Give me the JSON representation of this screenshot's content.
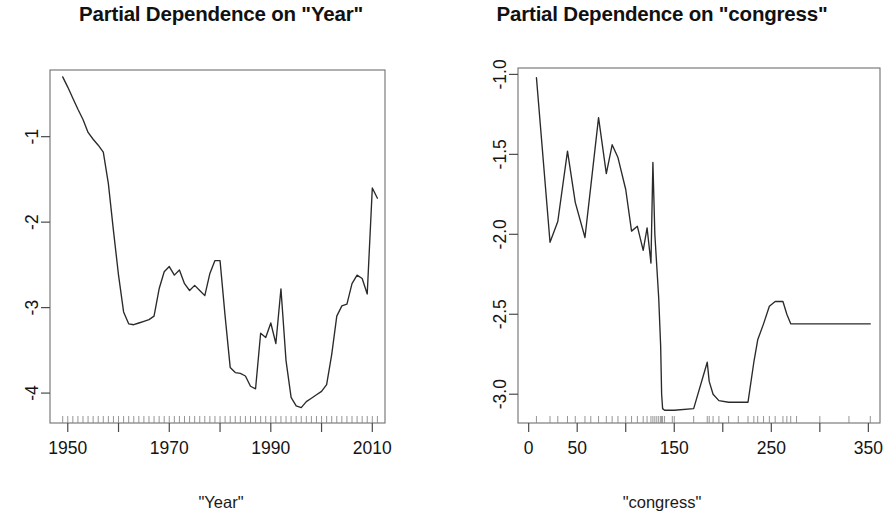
{
  "page": {
    "background": "#ffffff",
    "line_color": "#2a2a2a",
    "frame_color": "#6f6f6f",
    "width": 883,
    "height": 526
  },
  "panels": [
    {
      "id": "year",
      "title": "Partial Dependence on \"Year\"",
      "xlabel": "\"Year\""
    },
    {
      "id": "congress",
      "title": "Partial Dependence on \"congress\"",
      "xlabel": "\"congress\""
    }
  ],
  "chart_data": [
    {
      "type": "line",
      "title": "Partial Dependence on \"Year\"",
      "xlabel": "\"Year\"",
      "ylabel": "",
      "grid": false,
      "legend": null,
      "xlim": [
        1946.5,
        2012.5
      ],
      "ylim": [
        -4.35,
        -0.22
      ],
      "xticks": [
        1950,
        1960,
        1970,
        1980,
        1990,
        2000,
        2010
      ],
      "xtick_labels": [
        "1950",
        "",
        "1970",
        "",
        "1990",
        "",
        "2010"
      ],
      "yticks": [
        -1,
        -2,
        -3,
        -4
      ],
      "ytick_labels": [
        "-1",
        "-2",
        "-3",
        "-4"
      ],
      "x": [
        1949,
        1950,
        1951,
        1952,
        1953,
        1954,
        1955,
        1956,
        1957,
        1958,
        1959,
        1960,
        1961,
        1962,
        1963,
        1964,
        1965,
        1966,
        1967,
        1968,
        1969,
        1970,
        1971,
        1972,
        1973,
        1974,
        1975,
        1976,
        1977,
        1978,
        1979,
        1980,
        1981,
        1982,
        1983,
        1984,
        1985,
        1986,
        1987,
        1988,
        1989,
        1990,
        1991,
        1992,
        1993,
        1994,
        1995,
        1996,
        1997,
        1998,
        1999,
        2000,
        2001,
        2002,
        2003,
        2004,
        2005,
        2006,
        2007,
        2008,
        2009,
        2010,
        2011
      ],
      "y": [
        -0.3,
        -0.42,
        -0.55,
        -0.68,
        -0.8,
        -0.95,
        -1.03,
        -1.1,
        -1.18,
        -1.55,
        -2.1,
        -2.62,
        -3.05,
        -3.19,
        -3.2,
        -3.18,
        -3.16,
        -3.14,
        -3.1,
        -2.78,
        -2.58,
        -2.52,
        -2.62,
        -2.56,
        -2.72,
        -2.8,
        -2.74,
        -2.8,
        -2.86,
        -2.6,
        -2.45,
        -2.45,
        -3.1,
        -3.7,
        -3.76,
        -3.77,
        -3.8,
        -3.92,
        -3.95,
        -3.3,
        -3.35,
        -3.18,
        -3.42,
        -2.78,
        -3.62,
        -4.05,
        -4.15,
        -4.17,
        -4.1,
        -4.06,
        -4.02,
        -3.98,
        -3.9,
        -3.55,
        -3.1,
        -2.98,
        -2.96,
        -2.72,
        -2.62,
        -2.66,
        -2.84,
        -1.6,
        -1.72
      ],
      "series": [
        {
          "name": "partial dependence",
          "values": [
            -0.3,
            -0.42,
            -0.55,
            -0.68,
            -0.8,
            -0.95,
            -1.03,
            -1.1,
            -1.18,
            -1.55,
            -2.1,
            -2.62,
            -3.05,
            -3.19,
            -3.2,
            -3.18,
            -3.16,
            -3.14,
            -3.1,
            -2.78,
            -2.58,
            -2.52,
            -2.62,
            -2.56,
            -2.72,
            -2.8,
            -2.74,
            -2.8,
            -2.86,
            -2.6,
            -2.45,
            -2.45,
            -3.1,
            -3.7,
            -3.76,
            -3.77,
            -3.8,
            -3.92,
            -3.95,
            -3.3,
            -3.35,
            -3.18,
            -3.42,
            -2.78,
            -3.62,
            -4.05,
            -4.15,
            -4.17,
            -4.1,
            -4.06,
            -4.02,
            -3.98,
            -3.9,
            -3.55,
            -3.1,
            -2.98,
            -2.96,
            -2.72,
            -2.62,
            -2.66,
            -2.84,
            -1.6,
            -1.72
          ]
        }
      ]
    },
    {
      "type": "line",
      "title": "Partial Dependence on \"congress\"",
      "xlabel": "\"congress\"",
      "ylabel": "",
      "grid": false,
      "legend": null,
      "xlim": [
        -11,
        362
      ],
      "ylim": [
        -3.18,
        -0.96
      ],
      "xticks": [
        0,
        50,
        100,
        150,
        200,
        250,
        300,
        350
      ],
      "xtick_labels": [
        "0",
        "50",
        "",
        "150",
        "",
        "250",
        "",
        "350"
      ],
      "yticks": [
        -1.0,
        -1.5,
        -2.0,
        -2.5,
        -3.0
      ],
      "ytick_labels": [
        "-1.0",
        "-1.5",
        "-2.0",
        "-2.5",
        "-3.0"
      ],
      "x": [
        8,
        22,
        30,
        40,
        48,
        58,
        64,
        72,
        80,
        86,
        92,
        100,
        106,
        112,
        118,
        122,
        126,
        128,
        130,
        132,
        134,
        136,
        137,
        138,
        140,
        148,
        150,
        170,
        184,
        186,
        190,
        196,
        206,
        216,
        226,
        232,
        236,
        242,
        248,
        254,
        262,
        266,
        270,
        276,
        300,
        330,
        352
      ],
      "y": [
        -1.02,
        -2.05,
        -1.92,
        -1.48,
        -1.8,
        -2.02,
        -1.7,
        -1.27,
        -1.62,
        -1.44,
        -1.52,
        -1.72,
        -1.98,
        -1.95,
        -2.1,
        -1.96,
        -2.18,
        -1.55,
        -2.0,
        -2.2,
        -2.4,
        -2.7,
        -3.0,
        -3.09,
        -3.1,
        -3.1,
        -3.1,
        -3.09,
        -2.8,
        -2.92,
        -3.0,
        -3.04,
        -3.05,
        -3.05,
        -3.05,
        -2.8,
        -2.66,
        -2.56,
        -2.45,
        -2.42,
        -2.42,
        -2.5,
        -2.56,
        -2.56,
        -2.56,
        -2.56,
        -2.56
      ],
      "series": [
        {
          "name": "partial dependence",
          "values": [
            -1.02,
            -2.05,
            -1.92,
            -1.48,
            -1.8,
            -2.02,
            -1.7,
            -1.27,
            -1.62,
            -1.44,
            -1.52,
            -1.72,
            -1.98,
            -1.95,
            -2.1,
            -1.96,
            -2.18,
            -1.55,
            -2.0,
            -2.2,
            -2.4,
            -2.7,
            -3.0,
            -3.09,
            -3.1,
            -3.1,
            -3.1,
            -3.09,
            -2.8,
            -2.92,
            -3.0,
            -3.04,
            -3.05,
            -3.05,
            -3.05,
            -2.8,
            -2.66,
            -2.56,
            -2.45,
            -2.42,
            -2.42,
            -2.5,
            -2.56,
            -2.56,
            -2.56,
            -2.56,
            -2.56
          ]
        }
      ]
    }
  ]
}
